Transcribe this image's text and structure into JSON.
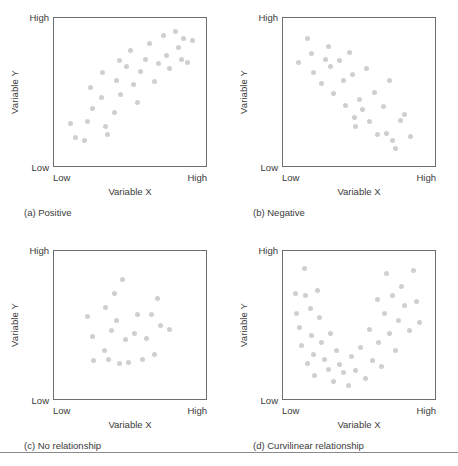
{
  "figure": {
    "axis_labels": {
      "x": "Variable X",
      "y": "Variable Y",
      "low": "Low",
      "high": "High"
    },
    "panels": [
      {
        "key": "a",
        "caption": "(a) Positive"
      },
      {
        "key": "b",
        "caption": "(b) Negative"
      },
      {
        "key": "c",
        "caption": "(c) No relationship"
      },
      {
        "key": "d",
        "caption": "(d) Curvilinear relationship"
      }
    ],
    "colors": {
      "dot": "#cfcfcf",
      "frame": "#6e6e6e",
      "text": "#3a3a3a",
      "rule": "#8a8a8a",
      "background": "#ffffff"
    }
  },
  "chart_data": [
    {
      "type": "scatter",
      "panel": "a",
      "title": "(a) Positive",
      "xlabel": "Variable X",
      "ylabel": "Variable Y",
      "xlim": [
        0,
        100
      ],
      "ylim": [
        0,
        100
      ],
      "xtick_labels": [
        "Low",
        "High"
      ],
      "ytick_labels": [
        "Low",
        "High"
      ],
      "grid": false,
      "legend": null,
      "relationship": "positive linear",
      "points": [
        [
          11,
          29
        ],
        [
          14,
          19
        ],
        [
          20,
          17
        ],
        [
          22,
          30
        ],
        [
          25,
          39
        ],
        [
          24,
          53
        ],
        [
          31,
          46
        ],
        [
          32,
          63
        ],
        [
          34,
          27
        ],
        [
          35,
          21
        ],
        [
          40,
          36
        ],
        [
          41,
          58
        ],
        [
          43,
          71
        ],
        [
          44,
          48
        ],
        [
          48,
          67
        ],
        [
          50,
          78
        ],
        [
          52,
          55
        ],
        [
          55,
          43
        ],
        [
          57,
          64
        ],
        [
          60,
          72
        ],
        [
          63,
          83
        ],
        [
          66,
          57
        ],
        [
          69,
          69
        ],
        [
          72,
          88
        ],
        [
          74,
          75
        ],
        [
          76,
          66
        ],
        [
          80,
          91
        ],
        [
          82,
          80
        ],
        [
          84,
          72
        ],
        [
          85,
          86
        ],
        [
          88,
          70
        ],
        [
          91,
          85
        ]
      ]
    },
    {
      "type": "scatter",
      "panel": "b",
      "title": "(b) Negative",
      "xlabel": "Variable X",
      "ylabel": "Variable Y",
      "xlim": [
        0,
        100
      ],
      "ylim": [
        0,
        100
      ],
      "xtick_labels": [
        "Low",
        "High"
      ],
      "ytick_labels": [
        "Low",
        "High"
      ],
      "grid": false,
      "legend": null,
      "relationship": "negative linear",
      "points": [
        [
          10,
          70
        ],
        [
          16,
          86
        ],
        [
          19,
          76
        ],
        [
          20,
          63
        ],
        [
          25,
          56
        ],
        [
          28,
          72
        ],
        [
          30,
          81
        ],
        [
          31,
          67
        ],
        [
          33,
          49
        ],
        [
          37,
          71
        ],
        [
          40,
          58
        ],
        [
          41,
          41
        ],
        [
          44,
          77
        ],
        [
          46,
          62
        ],
        [
          47,
          33
        ],
        [
          48,
          27
        ],
        [
          50,
          45
        ],
        [
          52,
          38
        ],
        [
          55,
          66
        ],
        [
          57,
          30
        ],
        [
          60,
          50
        ],
        [
          62,
          21
        ],
        [
          66,
          40
        ],
        [
          68,
          22
        ],
        [
          70,
          58
        ],
        [
          72,
          17
        ],
        [
          74,
          12
        ],
        [
          77,
          31
        ],
        [
          80,
          35
        ],
        [
          84,
          20
        ]
      ]
    },
    {
      "type": "scatter",
      "panel": "c",
      "title": "(c) No relationship",
      "xlabel": "Variable X",
      "ylabel": "Variable Y",
      "xlim": [
        0,
        100
      ],
      "ylim": [
        0,
        100
      ],
      "xtick_labels": [
        "Low",
        "High"
      ],
      "ytick_labels": [
        "Low",
        "High"
      ],
      "grid": false,
      "legend": null,
      "relationship": "none",
      "points": [
        [
          22,
          56
        ],
        [
          25,
          42
        ],
        [
          26,
          26
        ],
        [
          33,
          33
        ],
        [
          34,
          62
        ],
        [
          36,
          27
        ],
        [
          38,
          46
        ],
        [
          40,
          71
        ],
        [
          41,
          53
        ],
        [
          43,
          24
        ],
        [
          45,
          81
        ],
        [
          47,
          40
        ],
        [
          49,
          25
        ],
        [
          53,
          44
        ],
        [
          55,
          57
        ],
        [
          58,
          27
        ],
        [
          61,
          41
        ],
        [
          64,
          57
        ],
        [
          66,
          30
        ],
        [
          68,
          68
        ],
        [
          70,
          50
        ],
        [
          76,
          47
        ]
      ]
    },
    {
      "type": "scatter",
      "panel": "d",
      "title": "(d) Curvilinear relationship",
      "xlabel": "Variable X",
      "ylabel": "Variable Y",
      "xlim": [
        0,
        100
      ],
      "ylim": [
        0,
        100
      ],
      "xtick_labels": [
        "Low",
        "High"
      ],
      "ytick_labels": [
        "Low",
        "High"
      ],
      "grid": false,
      "legend": null,
      "relationship": "curvilinear (U-shaped)",
      "points": [
        [
          8,
          71
        ],
        [
          9,
          58
        ],
        [
          11,
          48
        ],
        [
          12,
          36
        ],
        [
          14,
          88
        ],
        [
          15,
          70
        ],
        [
          16,
          24
        ],
        [
          18,
          61
        ],
        [
          19,
          43
        ],
        [
          20,
          30
        ],
        [
          21,
          16
        ],
        [
          23,
          73
        ],
        [
          24,
          55
        ],
        [
          25,
          38
        ],
        [
          27,
          27
        ],
        [
          30,
          20
        ],
        [
          31,
          44
        ],
        [
          33,
          12
        ],
        [
          35,
          33
        ],
        [
          37,
          23
        ],
        [
          40,
          18
        ],
        [
          43,
          9
        ],
        [
          45,
          29
        ],
        [
          48,
          19
        ],
        [
          51,
          35
        ],
        [
          54,
          14
        ],
        [
          57,
          47
        ],
        [
          59,
          26
        ],
        [
          62,
          67
        ],
        [
          63,
          38
        ],
        [
          65,
          22
        ],
        [
          67,
          58
        ],
        [
          68,
          85
        ],
        [
          70,
          44
        ],
        [
          72,
          70
        ],
        [
          74,
          33
        ],
        [
          76,
          53
        ],
        [
          78,
          76
        ],
        [
          80,
          63
        ],
        [
          83,
          46
        ],
        [
          86,
          87
        ],
        [
          88,
          66
        ],
        [
          90,
          52
        ]
      ]
    }
  ]
}
